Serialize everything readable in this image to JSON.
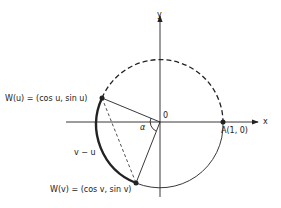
{
  "diagram": {
    "type": "unit-circle",
    "axes": {
      "x_label": "x",
      "y_label": "y"
    },
    "origin_label": "0",
    "points": {
      "A": {
        "label": "A(1, 0)"
      },
      "Wu": {
        "label": "W(u) = (cos u, sin u)"
      },
      "Wv": {
        "label": "W(v) = (cos v, sin v)"
      }
    },
    "angle_label": "α",
    "arc_label": "v − u",
    "colors": {
      "ink": "#222222",
      "background": "#ffffff"
    }
  }
}
